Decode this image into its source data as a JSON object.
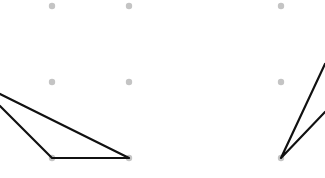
{
  "canvas": {
    "width": 325,
    "height": 178,
    "background": "#ffffff"
  },
  "grid": {
    "dot_color": "#c4c4c4",
    "dot_radius": 3.2,
    "dots": [
      {
        "x": 52,
        "y": 6
      },
      {
        "x": 129,
        "y": 6
      },
      {
        "x": 281,
        "y": 6
      },
      {
        "x": 52,
        "y": 82
      },
      {
        "x": 129,
        "y": 82
      },
      {
        "x": 281,
        "y": 82
      },
      {
        "x": 52,
        "y": 158
      },
      {
        "x": 129,
        "y": 158
      },
      {
        "x": 281,
        "y": 158
      }
    ]
  },
  "shapes": {
    "stroke_color": "#111111",
    "stroke_width": 2.2,
    "left_polyline": [
      [
        0,
        94
      ],
      [
        129,
        158
      ],
      [
        52,
        158
      ],
      [
        0,
        106
      ]
    ],
    "right_polyline": [
      [
        325,
        64
      ],
      [
        281,
        158
      ],
      [
        325,
        112
      ]
    ]
  }
}
